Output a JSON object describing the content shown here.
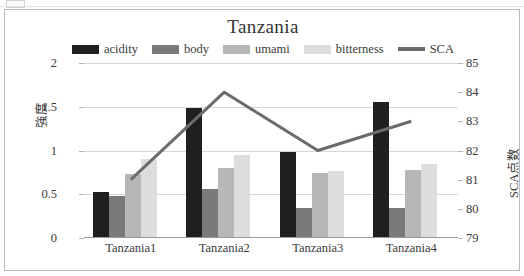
{
  "chart_data": {
    "type": "bar",
    "title": "Tanzania",
    "xlabel": "",
    "ylabel": "強度",
    "y2label": "SCA点数",
    "categories": [
      "Tanzania1",
      "Tanzania2",
      "Tanzania3",
      "Tanzania4"
    ],
    "ylim": [
      0,
      2
    ],
    "yticks": [
      "0",
      "0.5",
      "1",
      "1.5",
      "2"
    ],
    "ytick_values": [
      0,
      0.5,
      1,
      1.5,
      2
    ],
    "y2lim": [
      79,
      85
    ],
    "y2ticks": [
      "79",
      "80",
      "81",
      "82",
      "83",
      "84",
      "85"
    ],
    "y2tick_values": [
      79,
      80,
      81,
      82,
      83,
      84,
      85
    ],
    "grid": true,
    "legend_position": "top",
    "series": [
      {
        "name": "acidity",
        "type": "bar",
        "axis": "left",
        "color": "#1f1f1f",
        "values": [
          0.52,
          1.48,
          0.97,
          1.54
        ]
      },
      {
        "name": "body",
        "type": "bar",
        "axis": "left",
        "color": "#7a7a7a",
        "values": [
          0.47,
          0.55,
          0.33,
          0.33
        ]
      },
      {
        "name": "umami",
        "type": "bar",
        "axis": "left",
        "color": "#b7b7b7",
        "values": [
          0.72,
          0.79,
          0.73,
          0.77
        ]
      },
      {
        "name": "bitterness",
        "type": "bar",
        "axis": "left",
        "color": "#dddddd",
        "values": [
          0.89,
          0.94,
          0.75,
          0.84
        ]
      },
      {
        "name": "SCA",
        "type": "line",
        "axis": "right",
        "color": "#6b6b6b",
        "values": [
          81.0,
          84.0,
          82.0,
          83.0
        ]
      }
    ]
  },
  "legend": {
    "items": [
      {
        "label": "acidity",
        "marker": "swatch"
      },
      {
        "label": "body",
        "marker": "swatch"
      },
      {
        "label": "umami",
        "marker": "swatch"
      },
      {
        "label": "bitterness",
        "marker": "swatch"
      },
      {
        "label": "SCA",
        "marker": "line"
      }
    ]
  }
}
